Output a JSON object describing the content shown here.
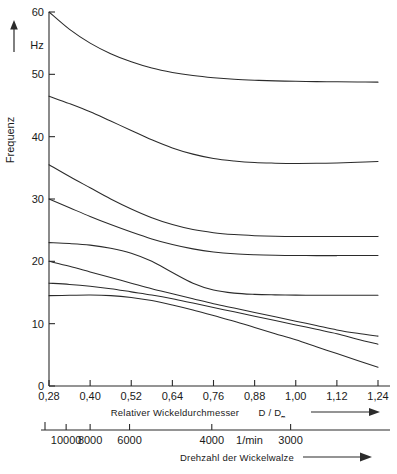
{
  "chart_data": {
    "type": "line",
    "title": "",
    "xlabel": "Relativer Wickeldurchmesser  D / Dₘ",
    "xlabel_secondary": "Drehzahl der Wickelwalze",
    "ylabel": "Frequenz",
    "yunit": "Hz",
    "xunit_secondary": "1/min",
    "xlim": [
      0.28,
      1.24
    ],
    "ylim": [
      0,
      60
    ],
    "grid": false,
    "legend": "none",
    "x_ticks": [
      "0,28",
      "0,40",
      "0,52",
      "0,64",
      "0,76",
      "0,88",
      "1,00",
      "1,12",
      "1,24"
    ],
    "x_tick_values": [
      0.28,
      0.4,
      0.52,
      0.64,
      0.76,
      0.88,
      1.0,
      1.12,
      1.24
    ],
    "y_ticks": [
      "0",
      "10",
      "20",
      "30",
      "40",
      "50",
      "60"
    ],
    "y_tick_values": [
      0,
      10,
      20,
      30,
      40,
      50,
      60
    ],
    "secondary_ticks": [
      {
        "label": "10000",
        "x": 0.33
      },
      {
        "label": "8000",
        "x": 0.4
      },
      {
        "label": "6000",
        "x": 0.515
      },
      {
        "label": "4000",
        "x": 0.755
      },
      {
        "label": "1/min",
        "x": 0.865
      },
      {
        "label": "3000",
        "x": 0.985
      }
    ],
    "x": [
      0.28,
      0.34,
      0.4,
      0.46,
      0.52,
      0.58,
      0.64,
      0.7,
      0.76,
      0.82,
      0.88,
      0.94,
      1.0,
      1.06,
      1.12,
      1.18,
      1.24
    ],
    "series": [
      {
        "name": "curve-1",
        "values": [
          60.0,
          57.2,
          55.0,
          53.3,
          52.0,
          51.0,
          50.3,
          49.8,
          49.45,
          49.2,
          49.05,
          48.95,
          48.88,
          48.83,
          48.8,
          48.78,
          48.75
        ]
      },
      {
        "name": "curve-2",
        "values": [
          46.5,
          45.3,
          44.0,
          42.5,
          41.0,
          39.5,
          38.2,
          37.2,
          36.5,
          36.1,
          35.85,
          35.75,
          35.7,
          35.72,
          35.78,
          35.88,
          36.0
        ]
      },
      {
        "name": "curve-3",
        "values": [
          35.5,
          33.6,
          31.8,
          30.0,
          28.4,
          27.0,
          25.9,
          25.1,
          24.6,
          24.3,
          24.12,
          24.02,
          23.98,
          23.97,
          23.97,
          23.98,
          24.0
        ]
      },
      {
        "name": "curve-4",
        "values": [
          30.0,
          28.6,
          27.2,
          25.9,
          24.7,
          23.6,
          22.7,
          22.0,
          21.5,
          21.2,
          21.05,
          20.97,
          20.93,
          20.92,
          20.92,
          20.93,
          20.95
        ]
      },
      {
        "name": "curve-5",
        "values": [
          23.0,
          22.85,
          22.6,
          22.1,
          21.3,
          20.0,
          18.2,
          16.5,
          15.4,
          14.9,
          14.7,
          14.62,
          14.58,
          14.56,
          14.55,
          14.55,
          14.55
        ]
      },
      {
        "name": "curve-6",
        "values": [
          20.0,
          19.2,
          18.3,
          17.4,
          16.5,
          15.6,
          14.8,
          14.0,
          13.2,
          12.5,
          11.8,
          11.1,
          10.4,
          9.7,
          9.0,
          8.45,
          8.0
        ]
      },
      {
        "name": "curve-7",
        "values": [
          16.5,
          16.3,
          16.0,
          15.6,
          15.1,
          14.6,
          14.0,
          13.3,
          12.6,
          11.9,
          11.2,
          10.5,
          9.8,
          9.1,
          8.4,
          7.5,
          6.7
        ]
      },
      {
        "name": "curve-8",
        "values": [
          14.5,
          14.55,
          14.6,
          14.5,
          14.2,
          13.7,
          13.0,
          12.2,
          11.3,
          10.4,
          9.4,
          8.4,
          7.4,
          6.3,
          5.2,
          4.1,
          3.0
        ]
      }
    ]
  },
  "axes": {
    "y_title": "Frequenz",
    "y_unit": "Hz",
    "x_title": "Relativer Wickeldurchmesser",
    "x_symbol": "D / D",
    "x_symbol_sub": "ₘ",
    "x2_title": "Drehzahl der Wickelwalze",
    "x2_unit": "1/min"
  }
}
